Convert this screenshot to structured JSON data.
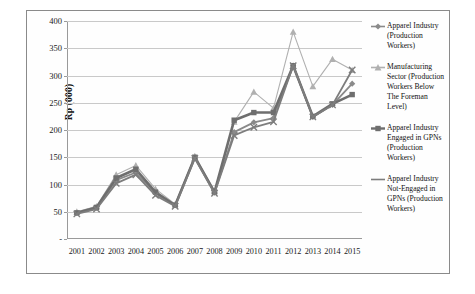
{
  "chart_data": {
    "type": "line",
    "title": "",
    "xlabel": "",
    "ylabel": "Rp (000)",
    "ylim": [
      0,
      400
    ],
    "ytick_labels": [
      "400",
      "350",
      "300",
      "250",
      "200",
      "150",
      "100",
      "50",
      "-"
    ],
    "ytick_values": [
      400,
      350,
      300,
      250,
      200,
      150,
      100,
      50,
      0
    ],
    "grid": true,
    "legend_position": "right",
    "categories": [
      "2001",
      "2002",
      "2003",
      "2004",
      "2005",
      "2006",
      "2007",
      "2008",
      "2009",
      "2010",
      "2011",
      "2012",
      "2013",
      "2014",
      "2015"
    ],
    "series": [
      {
        "name": "Apparel Industry (Production Workers)",
        "marker": "diamond",
        "color": "#8a8a8a",
        "values": [
          48,
          57,
          108,
          122,
          84,
          62,
          150,
          85,
          196,
          214,
          222,
          318,
          224,
          246,
          285
        ]
      },
      {
        "name": "Manufacturing Sector (Production Workers Below The Foreman Level)",
        "marker": "triangle",
        "color": "#b0b0b0",
        "values": [
          50,
          60,
          118,
          135,
          92,
          64,
          152,
          88,
          215,
          270,
          240,
          380,
          280,
          330,
          310
        ]
      },
      {
        "name": "Apparel Industry Engaged in GPNs (Production Workers)",
        "marker": "square",
        "color": "#6e6e6e",
        "values": [
          48,
          58,
          112,
          128,
          86,
          62,
          150,
          86,
          218,
          232,
          232,
          318,
          225,
          248,
          265
        ]
      },
      {
        "name": "Apparel Industry Not-Engaged in GPNs (Production Workers)",
        "marker": "x",
        "color": "#7d7d7d",
        "values": [
          46,
          55,
          102,
          118,
          80,
          60,
          148,
          84,
          190,
          205,
          215,
          318,
          224,
          246,
          310
        ]
      }
    ]
  },
  "legend": {
    "entries": [
      {
        "label": "Apparel Industry (Production Workers)",
        "marker": "diamond-marker-icon"
      },
      {
        "label": "Manufacturing Sector (Production Workers Below The Foreman Level)",
        "marker": "triangle-marker-icon"
      },
      {
        "label": "Apparel Industry Engaged in GPNs (Production Workers)",
        "marker": "square-marker-icon"
      },
      {
        "label": "Apparel Industry Not-Engaged in GPNs (Production Workers)",
        "marker": "line-marker-icon"
      }
    ]
  }
}
